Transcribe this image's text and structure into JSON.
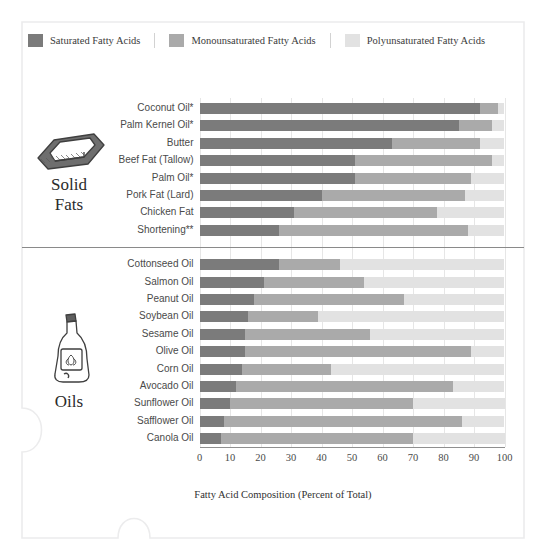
{
  "legend": {
    "items": [
      {
        "label": "Saturated Fatty Acids",
        "color": "#7b7b7b",
        "key": "saturated"
      },
      {
        "label": "Monounsaturated Fatty Acids",
        "color": "#aaaaaa",
        "key": "monounsaturated"
      },
      {
        "label": "Polyunsaturated Fatty Acids",
        "color": "#e2e2e2",
        "key": "polyunsaturated"
      }
    ]
  },
  "groups": [
    {
      "key": "solid-fats",
      "title_line1": "Solid",
      "title_line2": "Fats",
      "icon": "butter-stick-icon"
    },
    {
      "key": "oils",
      "title_line1": "Oils",
      "title_line2": "",
      "icon": "oil-bottle-icon"
    }
  ],
  "axis": {
    "label": "Fatty Acid Composition (Percent of Total)",
    "ticks": [
      "0",
      "10",
      "20",
      "30",
      "40",
      "50",
      "60",
      "70",
      "80",
      "90",
      "100"
    ],
    "min": 0,
    "max": 100
  },
  "footnotes": {
    "single_star": "*",
    "double_star": "**"
  },
  "chart_data": {
    "type": "bar",
    "orientation": "horizontal",
    "stacked": true,
    "title": "",
    "xlabel": "Fatty Acid Composition (Percent of Total)",
    "ylabel": "",
    "xlim": [
      0,
      100
    ],
    "grid": true,
    "legend_position": "top",
    "series": [
      {
        "name": "Saturated Fatty Acids",
        "color": "#7b7b7b",
        "values": [
          92,
          85,
          63,
          51,
          51,
          40,
          31,
          26,
          26,
          21,
          18,
          16,
          15,
          15,
          14,
          12,
          10,
          8,
          7
        ]
      },
      {
        "name": "Monounsaturated Fatty Acids",
        "color": "#aaaaaa",
        "values": [
          6,
          11,
          29,
          45,
          38,
          47,
          47,
          62,
          20,
          33,
          49,
          23,
          41,
          74,
          29,
          71,
          60,
          78,
          63
        ]
      },
      {
        "name": "Polyunsaturated Fatty Acids",
        "color": "#e2e2e2",
        "values": [
          2,
          4,
          8,
          4,
          11,
          13,
          22,
          12,
          54,
          46,
          33,
          61,
          44,
          11,
          57,
          17,
          30,
          14,
          30
        ]
      }
    ],
    "categories": [
      "Coconut Oil*",
      "Palm Kernel Oil*",
      "Butter",
      "Beef Fat (Tallow)",
      "Palm Oil*",
      "Pork Fat (Lard)",
      "Chicken Fat",
      "Shortening**",
      "Cottonseed  Oil",
      "Salmon Oil",
      "Peanut Oil",
      "Soybean Oil",
      "Sesame Oil",
      "Olive Oil",
      "Corn Oil",
      "Avocado Oil",
      "Sunflower Oil",
      "Safflower Oil",
      "Canola Oil"
    ],
    "group_split_index": 8
  }
}
